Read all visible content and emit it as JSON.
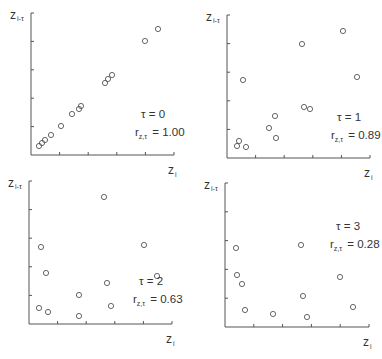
{
  "figure": {
    "y_axis_label_main": "z",
    "y_axis_label_sub": "i-τ",
    "x_axis_label_main": "z",
    "x_axis_label_sub": "i"
  },
  "chart_data": [
    {
      "type": "scatter",
      "title": "",
      "xlabel": "z_i",
      "ylabel": "z_{i-τ}",
      "grid": false,
      "annotation_tau": "τ = 0",
      "annotation_r_prefix": "r",
      "annotation_r_sub": "z,τ",
      "annotation_r_value": "= 1.00",
      "tau": 0,
      "r": 1.0,
      "axis": {
        "x0": 31,
        "x1": 174,
        "y0": 155,
        "y1": 13
      },
      "points_px": [
        [
          39,
          146
        ],
        [
          42,
          143
        ],
        [
          45,
          140
        ],
        [
          51,
          135
        ],
        [
          61,
          126
        ],
        [
          72,
          114
        ],
        [
          79,
          109
        ],
        [
          81,
          106
        ],
        [
          105,
          83
        ],
        [
          108,
          79
        ],
        [
          112,
          75
        ],
        [
          145,
          41
        ],
        [
          158,
          29
        ]
      ]
    },
    {
      "type": "scatter",
      "title": "",
      "xlabel": "z_i",
      "ylabel": "z_{i-τ}",
      "grid": false,
      "annotation_tau": "τ = 1",
      "annotation_r_prefix": "r",
      "annotation_r_sub": "z,τ",
      "annotation_r_value": "= 0.89",
      "tau": 1,
      "r": 0.89,
      "axis": {
        "x0": 227,
        "x1": 370,
        "y0": 158,
        "y1": 15
      },
      "points_px": [
        [
          237,
          146
        ],
        [
          239,
          141
        ],
        [
          246,
          147
        ],
        [
          243,
          80
        ],
        [
          269,
          128
        ],
        [
          275,
          116
        ],
        [
          276,
          138
        ],
        [
          302,
          44
        ],
        [
          304,
          107
        ],
        [
          310,
          109
        ],
        [
          343,
          31
        ],
        [
          357,
          77
        ]
      ]
    },
    {
      "type": "scatter",
      "title": "",
      "xlabel": "z_i",
      "ylabel": "z_{i-τ}",
      "grid": false,
      "annotation_tau": "τ = 2",
      "annotation_r_prefix": "r",
      "annotation_r_sub": "z,τ",
      "annotation_r_value": "= 0.63",
      "tau": 2,
      "r": 0.63,
      "axis": {
        "x0": 29,
        "x1": 172,
        "y0": 324,
        "y1": 181
      },
      "points_px": [
        [
          41,
          247
        ],
        [
          46,
          273
        ],
        [
          39,
          308
        ],
        [
          48,
          312
        ],
        [
          79,
          295
        ],
        [
          79,
          316
        ],
        [
          104,
          197
        ],
        [
          107,
          283
        ],
        [
          111,
          306
        ],
        [
          144,
          245
        ],
        [
          157,
          276
        ]
      ]
    },
    {
      "type": "scatter",
      "title": "",
      "xlabel": "z_i",
      "ylabel": "z_{i-τ}",
      "grid": false,
      "annotation_tau": "τ = 3",
      "annotation_r_prefix": "r",
      "annotation_r_sub": "z,τ",
      "annotation_r_value": "= 0.28",
      "tau": 3,
      "r": 0.28,
      "axis": {
        "x0": 225,
        "x1": 369,
        "y0": 327,
        "y1": 183
      },
      "points_px": [
        [
          236,
          248
        ],
        [
          237,
          275
        ],
        [
          242,
          284
        ],
        [
          245,
          310
        ],
        [
          273,
          314
        ],
        [
          301,
          245
        ],
        [
          303,
          296
        ],
        [
          307,
          317
        ],
        [
          340,
          277
        ],
        [
          353,
          307
        ]
      ]
    }
  ]
}
